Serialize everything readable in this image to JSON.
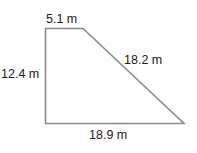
{
  "diagram": {
    "type": "right-trapezoid",
    "stroke_color": "#8a8a8a",
    "sides": {
      "top": "5.1 m",
      "left": "12.4 m",
      "slant": "18.2 m",
      "bottom": "18.9 m"
    }
  }
}
